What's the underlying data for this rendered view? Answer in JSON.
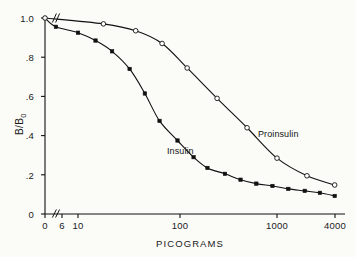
{
  "figure": {
    "background_color": "#fbfbf8",
    "ink_color": "#111111"
  },
  "chart_data": {
    "type": "line",
    "title": "",
    "subtitle": "",
    "xlabel": "PICOGRAMS",
    "ylabel": "B/B₀",
    "xscale": "log",
    "yscale": "linear",
    "xlim": [
      6,
      4000
    ],
    "ylim": [
      0,
      1.0
    ],
    "x_axis_break": true,
    "x_axis_break_note": "axis broken between 0 and 6 picograms",
    "grid": false,
    "legend": "inline-labels",
    "xticks": [
      0,
      6,
      10,
      100,
      1000,
      4000
    ],
    "xtick_labels": [
      "0",
      "6",
      "10",
      "100",
      "1000",
      "4000"
    ],
    "yticks": [
      0,
      0.2,
      0.4,
      0.6,
      0.8,
      1.0
    ],
    "ytick_labels": [
      "0",
      ".2",
      ".4",
      ".6",
      ".8",
      "1.0"
    ],
    "annotations": [
      {
        "text": "Insulin",
        "x": 90,
        "y": 0.33
      },
      {
        "text": "Proinsulin",
        "x": 700,
        "y": 0.3
      }
    ],
    "series": [
      {
        "name": "Insulin",
        "marker": "filled-square",
        "marker_color": "#111111",
        "line_color": "#111111",
        "x": [
          0,
          6,
          10,
          15,
          22,
          33,
          47,
          66,
          100,
          145,
          200,
          300,
          430,
          620,
          900,
          1300,
          1900,
          2700,
          3800
        ],
        "y": [
          1.0,
          0.955,
          0.925,
          0.885,
          0.83,
          0.74,
          0.615,
          0.475,
          0.375,
          0.29,
          0.235,
          0.205,
          0.175,
          0.155,
          0.143,
          0.128,
          0.118,
          0.108,
          0.092
        ]
      },
      {
        "name": "Proinsulin",
        "marker": "open-circle",
        "marker_color": "#ffffff",
        "line_color": "#111111",
        "x": [
          0,
          18,
          38,
          70,
          125,
          250,
          500,
          1000,
          2000,
          3800
        ],
        "y": [
          1.0,
          0.97,
          0.935,
          0.87,
          0.745,
          0.59,
          0.44,
          0.285,
          0.195,
          0.148
        ]
      }
    ]
  },
  "axis_titles": {
    "x": "PICOGRAMS",
    "y_main": "B/B",
    "y_sub": "0"
  }
}
